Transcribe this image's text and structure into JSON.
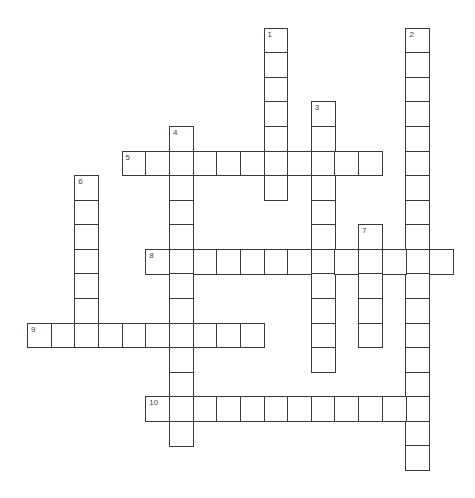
{
  "puzzle": {
    "grid": {
      "origin_x": 27,
      "origin_y": 27.7,
      "cell_w": 23.65,
      "cell_h": 24.57,
      "line_color": "#3a3a3a",
      "number_color": "#444444"
    },
    "words": [
      {
        "number": "1",
        "direction": "down",
        "row": 0,
        "col": 10,
        "length": 7
      },
      {
        "number": "2",
        "direction": "down",
        "row": 0,
        "col": 16,
        "length": 18
      },
      {
        "number": "3",
        "direction": "down",
        "row": 3,
        "col": 12,
        "length": 11
      },
      {
        "number": "4",
        "direction": "down",
        "row": 4,
        "col": 6,
        "length": 13
      },
      {
        "number": "5",
        "direction": "across",
        "row": 5,
        "col": 4,
        "length": 11
      },
      {
        "number": "6",
        "direction": "down",
        "row": 6,
        "col": 2,
        "length": 7
      },
      {
        "number": "7",
        "direction": "down",
        "row": 8,
        "col": 14,
        "length": 5
      },
      {
        "number": "8",
        "direction": "across",
        "row": 9,
        "col": 5,
        "length": 13
      },
      {
        "number": "9",
        "direction": "across",
        "row": 12,
        "col": 0,
        "length": 10
      },
      {
        "number": "10",
        "direction": "across",
        "row": 15,
        "col": 5,
        "length": 12
      }
    ]
  }
}
